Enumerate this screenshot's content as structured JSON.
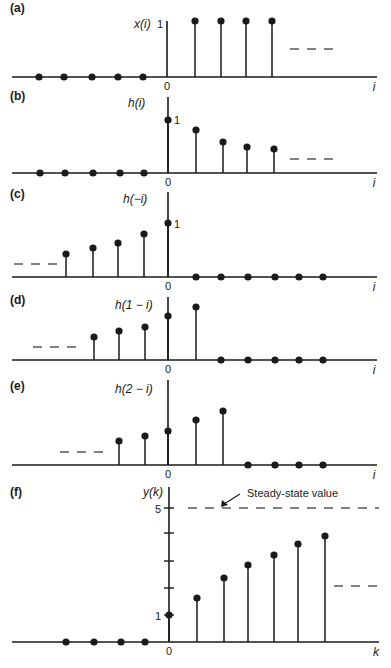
{
  "figure": {
    "colors": {
      "ink": "#1a1a1a",
      "background": "#ffffff"
    }
  },
  "chart_data": [
    {
      "type": "stem",
      "panel": "(a)",
      "ylabel": "x(i)",
      "xlabel": "i",
      "origin_label": "0",
      "y_tick_labels": [
        "1"
      ],
      "x": [
        -5,
        -4,
        -3,
        -2,
        -1,
        0,
        1,
        2,
        3,
        4
      ],
      "values": [
        0,
        0,
        0,
        0,
        0,
        1,
        1,
        1,
        1,
        1
      ],
      "continuation": "right (dashes at level ~0.6)"
    },
    {
      "type": "stem",
      "panel": "(b)",
      "ylabel": "h(i)",
      "xlabel": "i",
      "origin_label": "0",
      "y_tick_labels": [
        "1"
      ],
      "x": [
        -5,
        -4,
        -3,
        -2,
        -1,
        0,
        1,
        2,
        3,
        4
      ],
      "values": [
        0,
        0,
        0,
        0,
        0,
        1,
        0.82,
        0.62,
        0.55,
        0.52
      ],
      "continuation": "right (dashes)"
    },
    {
      "type": "stem",
      "panel": "(c)",
      "ylabel": "h(−i)",
      "xlabel": "i",
      "origin_label": "0",
      "y_tick_labels": [
        "1"
      ],
      "x": [
        -4,
        -3,
        -2,
        -1,
        0,
        1,
        2,
        3,
        4,
        5,
        6
      ],
      "values": [
        0.52,
        0.55,
        0.62,
        0.82,
        1,
        0,
        0,
        0,
        0,
        0,
        0
      ],
      "continuation": "left (dashes)"
    },
    {
      "type": "stem",
      "panel": "(d)",
      "ylabel": "h(1 − i)",
      "xlabel": "i",
      "origin_label": "0",
      "x": [
        -3,
        -2,
        -1,
        0,
        1,
        2,
        3,
        4,
        5,
        6
      ],
      "values": [
        0.52,
        0.55,
        0.62,
        0.82,
        1,
        0,
        0,
        0,
        0,
        0
      ],
      "continuation": "left (dashes)"
    },
    {
      "type": "stem",
      "panel": "(e)",
      "ylabel": "h(2 − i)",
      "xlabel": "i",
      "origin_label": "0",
      "x": [
        -2,
        -1,
        0,
        1,
        2,
        3,
        4,
        5,
        6
      ],
      "values": [
        0.52,
        0.55,
        0.62,
        0.82,
        1,
        0,
        0,
        0,
        0
      ],
      "continuation": "left (dashes)"
    },
    {
      "type": "stem",
      "panel": "(f)",
      "ylabel": "y(k)",
      "xlabel": "k",
      "origin_label": "0",
      "y_ticks": [
        1,
        2,
        3,
        4,
        5
      ],
      "y_tick_labels": [
        "1",
        "5"
      ],
      "x": [
        -4,
        -3,
        -2,
        -1,
        0,
        1,
        2,
        3,
        4,
        5,
        6
      ],
      "values": [
        0,
        0,
        0,
        0,
        1,
        1.6,
        2.3,
        2.8,
        3.2,
        3.6,
        3.9
      ],
      "steady_state": 5,
      "annotation": "Steady-state value",
      "continuation": "right (dashes at ~2.4 level)"
    }
  ],
  "panels": [
    {
      "label": "(a)",
      "ylabel": "x(i)",
      "xname": "i",
      "origin": "0",
      "onelabel": "1",
      "labelPos": [
        10,
        12
      ],
      "ylabelPos": [
        134,
        28
      ],
      "oneLabelPos": [
        157,
        28
      ],
      "axis": {
        "x0": 12,
        "x1": 377,
        "y": 77,
        "ax": 167,
        "ytop": 21
      },
      "stems": [
        [
          195,
          21
        ],
        [
          221,
          21
        ],
        [
          246,
          21
        ],
        [
          272,
          21
        ]
      ],
      "zeroDots": [
        39,
        64,
        92,
        118,
        143
      ],
      "axisStemNoDot": true,
      "dashes": {
        "x0": 290,
        "x1": 334,
        "y": 49
      }
    },
    {
      "label": "(b)",
      "ylabel": "h(i)",
      "xname": "i",
      "origin": "0",
      "onelabel": "1",
      "labelPos": [
        10,
        100
      ],
      "ylabelPos": [
        128,
        107
      ],
      "oneLabelPos": [
        174,
        124
      ],
      "axis": {
        "x0": 12,
        "x1": 377,
        "y": 173,
        "ax": 168,
        "ytop": 97
      },
      "stems": [
        [
          168,
          120
        ],
        [
          196,
          130
        ],
        [
          223,
          142
        ],
        [
          247,
          147
        ],
        [
          274,
          149
        ]
      ],
      "zeroDots": [
        40,
        65,
        93,
        120,
        144
      ],
      "dashes": {
        "x0": 290,
        "x1": 334,
        "y": 159
      }
    },
    {
      "label": "(c)",
      "ylabel": "h(−i)",
      "xname": "i",
      "origin": "0",
      "onelabel": "1",
      "labelPos": [
        10,
        198
      ],
      "ylabelPos": [
        123,
        203
      ],
      "oneLabelPos": [
        174,
        228
      ],
      "axis": {
        "x0": 12,
        "x1": 377,
        "y": 277,
        "ax": 168,
        "ytop": 192
      },
      "stems": [
        [
          66,
          254
        ],
        [
          93,
          248
        ],
        [
          118,
          243
        ],
        [
          144,
          234
        ],
        [
          168,
          223
        ]
      ],
      "zeroDots": [
        196,
        221,
        248,
        275,
        299,
        323
      ],
      "dashes": {
        "x0": 14,
        "x1": 58,
        "y": 264
      }
    },
    {
      "label": "(d)",
      "ylabel": "h(1 − i)",
      "xname": "i",
      "origin": "0",
      "labelPos": [
        10,
        304
      ],
      "ylabelPos": [
        115,
        309
      ],
      "oneLabelPos": null,
      "axis": {
        "x0": 12,
        "x1": 377,
        "y": 360,
        "ax": 168,
        "ytop": 297
      },
      "stems": [
        [
          94,
          337
        ],
        [
          119,
          331
        ],
        [
          145,
          327
        ],
        [
          168,
          316
        ],
        [
          196,
          307
        ]
      ],
      "zeroDots": [
        221,
        248,
        275,
        299,
        323
      ],
      "dashes": {
        "x0": 33,
        "x1": 77,
        "y": 347
      }
    },
    {
      "label": "(e)",
      "ylabel": "h(2 − i)",
      "xname": "i",
      "origin": "0",
      "labelPos": [
        10,
        390
      ],
      "ylabelPos": [
        115,
        393
      ],
      "oneLabelPos": null,
      "axis": {
        "x0": 12,
        "x1": 377,
        "y": 465,
        "ax": 168,
        "ytop": 380
      },
      "stems": [
        [
          119,
          441
        ],
        [
          145,
          436
        ],
        [
          168,
          431
        ],
        [
          196,
          420
        ],
        [
          223,
          411
        ]
      ],
      "zeroDots": [
        248,
        275,
        299,
        323
      ],
      "dashes": {
        "x0": 60,
        "x1": 103,
        "y": 452
      }
    },
    {
      "label": "(f)",
      "ylabel": "y(k)",
      "xname": "k",
      "origin": "0",
      "onelabel": "1",
      "fivelabel": "5",
      "labelPos": [
        10,
        496
      ],
      "ylabelPos": [
        143,
        496
      ],
      "oneLabelPos": [
        155,
        620
      ],
      "fiveLabelPos": [
        155,
        513
      ],
      "axis": {
        "x0": 12,
        "x1": 379,
        "y": 642,
        "ax": 169,
        "ytop": 487
      },
      "ticks": [
        508,
        533,
        561,
        588,
        615
      ],
      "stems": [
        [
          169,
          615
        ],
        [
          197,
          598
        ],
        [
          224,
          578
        ],
        [
          248,
          565
        ],
        [
          274,
          555
        ],
        [
          298,
          544
        ],
        [
          325,
          536
        ]
      ],
      "zeroDots": [
        66,
        94,
        121,
        145
      ],
      "dashes": {
        "x0": 334,
        "x1": 379,
        "y": 586
      },
      "steady": {
        "x0": 188,
        "x1": 379,
        "y": 508
      },
      "annotation": {
        "text": "Steady-state value",
        "x": 247,
        "y": 497,
        "arrowFrom": [
          240,
          494
        ],
        "arrowTo": [
          221,
          507
        ]
      }
    }
  ]
}
